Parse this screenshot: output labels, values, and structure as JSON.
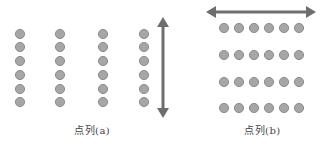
{
  "figure_a": {
    "label": "点列(a)",
    "columns_x": [
      20,
      60,
      103,
      144
    ],
    "rows_y": [
      34,
      47,
      61,
      75,
      89,
      102
    ],
    "arrow": {
      "direction": "vertical",
      "x": 163,
      "y1": 17,
      "y2": 118
    }
  },
  "figure_b": {
    "label": "点列(b)",
    "columns_x": [
      224,
      239,
      254,
      269,
      284,
      299
    ],
    "rows_y": [
      28,
      55,
      82,
      108
    ],
    "arrow": {
      "direction": "horizontal",
      "y": 12,
      "x1": 206,
      "x2": 316
    }
  },
  "colors": {
    "dot_fill": "#a6a6a6",
    "dot_stroke": "#7a7a7a",
    "arrow": "#6e6e6e",
    "text": "#444444"
  },
  "dot_radius": 4.6
}
